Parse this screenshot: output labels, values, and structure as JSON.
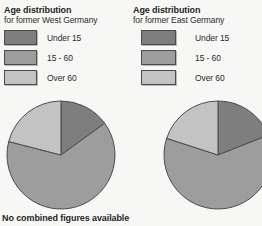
{
  "colors": {
    "under_15": "#7e7e7e",
    "15_60": "#9d9d9d",
    "over_60": "#c3c3c3",
    "outline": "#4b4b4b",
    "background": "#f7f7f5",
    "text": "#1f1f1f"
  },
  "chart_data": [
    {
      "type": "pie",
      "title": "Age distribution",
      "subtitle": "for former West Germany",
      "categories": [
        "Under 15",
        "15 - 60",
        "Over 60"
      ],
      "values": [
        15,
        64,
        21
      ],
      "unit": "percent",
      "colors": [
        "#7e7e7e",
        "#9d9d9d",
        "#c3c3c3"
      ],
      "start_angle": "12 o'clock",
      "direction": "clockwise",
      "legend_position": "above",
      "annotation": "No combined figures available"
    },
    {
      "type": "pie",
      "title": "Age distribution",
      "subtitle": "for former East Germany",
      "categories": [
        "Under 15",
        "15 - 60",
        "Over 60"
      ],
      "values": [
        19,
        61,
        20
      ],
      "unit": "percent",
      "colors": [
        "#7e7e7e",
        "#9d9d9d",
        "#c3c3c3"
      ],
      "start_angle": "12 o'clock",
      "direction": "clockwise",
      "legend_position": "above"
    }
  ]
}
